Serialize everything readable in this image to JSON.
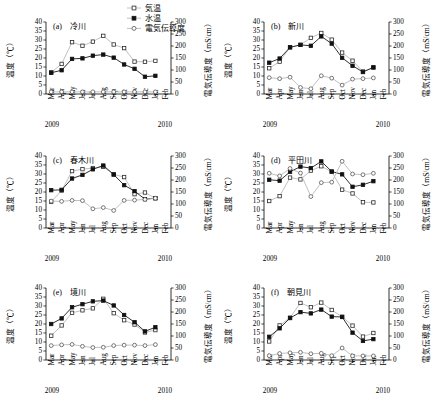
{
  "figure": {
    "width": 436,
    "height": 410,
    "legend": [
      {
        "key": "air",
        "label": "気温",
        "marker": "open-square",
        "color": "#b9b9b9"
      },
      {
        "key": "water",
        "label": "水温",
        "marker": "filled-square",
        "color": "#111111"
      },
      {
        "key": "ec",
        "label": "電気伝導度",
        "marker": "open-circle",
        "color": "#b9b9b9"
      }
    ],
    "axis_left_label": "温度（℃）",
    "axis_right_label": "電気伝導度（mS/cm）",
    "left_ticks": [
      0,
      5,
      10,
      15,
      20,
      25,
      30,
      35,
      40
    ],
    "right_ticks": [
      0,
      50,
      100,
      150,
      200,
      250,
      300
    ],
    "month_labels": [
      "Mar",
      "Apr",
      "May",
      "Jun",
      "Jul",
      "Aug",
      "Sep",
      "Oct",
      "Nov",
      "Dec",
      "Jan",
      "Feb"
    ],
    "year_left": "2009",
    "year_right": "2010"
  },
  "chart_data": [
    {
      "type": "line",
      "panel": "a",
      "title": "(a)　冷川",
      "xlabel": "",
      "ylabel": "温度（℃）",
      "y2label": "電気伝導度（mS/cm）",
      "ylim": [
        0,
        40
      ],
      "y2lim": [
        0,
        300
      ],
      "grid": false,
      "legend_position": "top-right-figure",
      "categories": [
        "Mar",
        "Apr",
        "May",
        "Jun",
        "Jul",
        "Aug",
        "Sep",
        "Oct",
        "Nov",
        "Dec",
        "Jan",
        "Feb"
      ],
      "series": [
        {
          "name": "気温",
          "axis": "left",
          "values": [
            12.0,
            16.7,
            28.8,
            26.8,
            29.1,
            32.3,
            27.5,
            25.5,
            18.0,
            17.9,
            18.4,
            null
          ]
        },
        {
          "name": "水温",
          "axis": "left",
          "values": [
            11.8,
            13.2,
            19.5,
            19.8,
            21.3,
            21.9,
            20.2,
            16.4,
            14.0,
            9.6,
            10.1,
            null
          ]
        },
        {
          "name": "電気伝導度",
          "axis": "right",
          "values": [
            9,
            9,
            9,
            9,
            9,
            9,
            9,
            9,
            9,
            9,
            9,
            null
          ]
        }
      ]
    },
    {
      "type": "line",
      "panel": "b",
      "title": "(b)　新川",
      "xlabel": "",
      "ylabel": "温度（℃）",
      "y2label": "電気伝導度（mS/cm）",
      "ylim": [
        0,
        40
      ],
      "y2lim": [
        0,
        300
      ],
      "grid": false,
      "categories": [
        "Mar",
        "Apr",
        "May",
        "Jun",
        "Jul",
        "Aug",
        "Sep",
        "Oct",
        "Nov",
        "Dec",
        "Jan",
        "Feb"
      ],
      "series": [
        {
          "name": "気温",
          "axis": "left",
          "values": [
            14.3,
            18.0,
            26.0,
            27.3,
            31.2,
            33.9,
            30.2,
            23.0,
            18.5,
            12.5,
            14.7,
            null
          ]
        },
        {
          "name": "水温",
          "axis": "left",
          "values": [
            17.4,
            19.7,
            25.9,
            27.3,
            26.8,
            32.0,
            28.0,
            20.1,
            15.7,
            12.2,
            14.8,
            null
          ]
        },
        {
          "name": "電気伝導度",
          "axis": "right",
          "values": [
            68,
            64,
            70,
            27,
            22,
            76,
            66,
            37,
            62,
            64,
            67,
            null
          ]
        }
      ]
    },
    {
      "type": "line",
      "panel": "c",
      "title": "(c)　春木川",
      "xlabel": "",
      "ylabel": "温度（℃）",
      "y2label": "電気伝導度（mS/cm）",
      "ylim": [
        0,
        40
      ],
      "y2lim": [
        0,
        300
      ],
      "grid": false,
      "categories": [
        "Mar",
        "Apr",
        "May",
        "Jun",
        "Jul",
        "Aug",
        "Sep",
        "Oct",
        "Nov",
        "Dec",
        "Jan",
        "Feb"
      ],
      "series": [
        {
          "name": "気温",
          "axis": "left",
          "values": [
            14.6,
            20.8,
            31.6,
            32.7,
            33.3,
            34.0,
            29.8,
            28.3,
            18.8,
            19.7,
            16.5,
            null
          ]
        },
        {
          "name": "水温",
          "axis": "left",
          "values": [
            21.0,
            21.2,
            27.5,
            29.5,
            32.6,
            34.7,
            29.7,
            23.8,
            20.5,
            16.0,
            16.6,
            null
          ]
        },
        {
          "name": "電気伝導度",
          "axis": "right",
          "values": [
            112,
            111,
            115,
            114,
            80,
            85,
            73,
            115,
            116,
            119,
            124,
            null
          ]
        }
      ]
    },
    {
      "type": "line",
      "panel": "d",
      "title": "(d)　平田川",
      "xlabel": "",
      "ylabel": "温度（℃）",
      "y2label": "電気伝導度（mS/cm）",
      "ylim": [
        0,
        40
      ],
      "y2lim": [
        0,
        300
      ],
      "grid": false,
      "categories": [
        "Mar",
        "Apr",
        "May",
        "Jun",
        "Jul",
        "Aug",
        "Sep",
        "Oct",
        "Nov",
        "Dec",
        "Jan",
        "Feb"
      ],
      "series": [
        {
          "name": "気温",
          "axis": "left",
          "values": [
            15.0,
            17.7,
            28.0,
            27.0,
            31.9,
            34.3,
            31.2,
            21.3,
            19.2,
            14.3,
            14.2,
            null
          ]
        },
        {
          "name": "水温",
          "axis": "left",
          "values": [
            26.8,
            26.3,
            31.2,
            34.1,
            33.3,
            37.0,
            31.4,
            29.8,
            22.9,
            24.0,
            26.0,
            null
          ]
        },
        {
          "name": "電気伝導度",
          "axis": "right",
          "values": [
            228,
            217,
            248,
            229,
            131,
            189,
            191,
            278,
            225,
            222,
            228,
            null
          ]
        }
      ]
    },
    {
      "type": "line",
      "panel": "e",
      "title": "(e)　境川",
      "xlabel": "",
      "ylabel": "温度（℃）",
      "y2label": "電気伝導度（mS/cm）",
      "ylim": [
        0,
        40
      ],
      "y2lim": [
        0,
        300
      ],
      "grid": false,
      "categories": [
        "Mar",
        "Apr",
        "May",
        "Jun",
        "Jul",
        "Aug",
        "Sep",
        "Oct",
        "Nov",
        "Dec",
        "Jan",
        "Feb"
      ],
      "series": [
        {
          "name": "気温",
          "axis": "left",
          "values": [
            13.5,
            19.2,
            26.2,
            27.6,
            28.7,
            34.0,
            26.0,
            22.1,
            19.7,
            15.3,
            16.6,
            null
          ]
        },
        {
          "name": "水温",
          "axis": "left",
          "values": [
            20.0,
            23.1,
            29.3,
            31.0,
            32.6,
            33.0,
            30.3,
            25.0,
            21.0,
            15.9,
            18.2,
            null
          ]
        },
        {
          "name": "電気伝導度",
          "axis": "right",
          "values": [
            60,
            63,
            65,
            57,
            52,
            53,
            60,
            62,
            62,
            60,
            64,
            null
          ]
        }
      ]
    },
    {
      "type": "line",
      "panel": "f",
      "title": "(f)　朝見川",
      "xlabel": "",
      "ylabel": "温度（℃）",
      "y2label": "電気伝導度（mS/cm）",
      "ylim": [
        0,
        40
      ],
      "y2lim": [
        0,
        300
      ],
      "grid": false,
      "categories": [
        "Mar",
        "Apr",
        "May",
        "Jun",
        "Jul",
        "Aug",
        "Sep",
        "Oct",
        "Nov",
        "Dec",
        "Jan",
        "Feb"
      ],
      "series": [
        {
          "name": "気温",
          "axis": "left",
          "values": [
            10.3,
            19.2,
            23.5,
            31.7,
            29.3,
            31.9,
            27.8,
            24.0,
            19.1,
            13.0,
            15.0,
            null
          ]
        },
        {
          "name": "水温",
          "axis": "left",
          "values": [
            12.9,
            17.6,
            23.3,
            26.6,
            25.9,
            28.0,
            24.1,
            23.9,
            15.2,
            10.6,
            11.6,
            null
          ]
        },
        {
          "name": "電気伝導度",
          "axis": "right",
          "values": [
            18,
            27,
            30,
            32,
            26,
            28,
            18,
            50,
            17,
            17,
            17,
            null
          ]
        }
      ]
    }
  ]
}
